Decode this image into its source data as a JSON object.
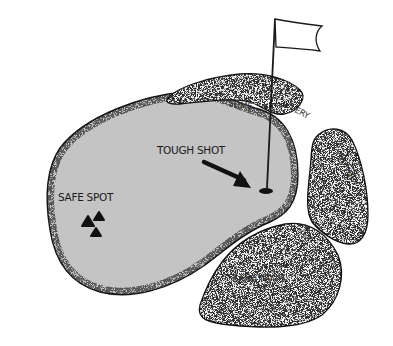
{
  "diagram": {
    "colors": {
      "green_fill": "#c4c4c4",
      "sand_fill": "#f4f4f4",
      "outline": "#1a1a1a",
      "background": "#ffffff"
    },
    "labels": {
      "safe_spot": "SAFE SPOT",
      "tough_shot": "TOUGH SHOT",
      "trap_1": "SOME",
      "trap_2": "VERY",
      "trap_3": "HUNGRY",
      "trap_4": "SAND TRAPS"
    },
    "icons": {
      "flag": "flag-icon",
      "hole": "hole-icon",
      "arrow": "arrow-icon",
      "markers": "triangle-marker-icon"
    },
    "marker_count": 3
  }
}
